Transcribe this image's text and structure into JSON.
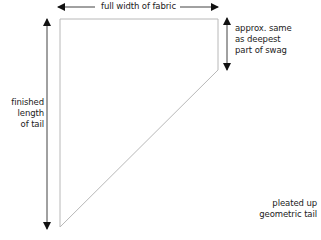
{
  "diagram": {
    "labels": {
      "top": "full width of fabric",
      "right_lines": [
        "approx. same",
        "as deepest",
        "part of swag"
      ],
      "left_lines": [
        "finished",
        "length",
        "of tail"
      ],
      "bottom_right_lines": [
        "pleated up",
        "geometric tail"
      ]
    },
    "colors": {
      "outline": "#b8b8b8",
      "arrow": "#111111",
      "text": "#222222"
    }
  }
}
